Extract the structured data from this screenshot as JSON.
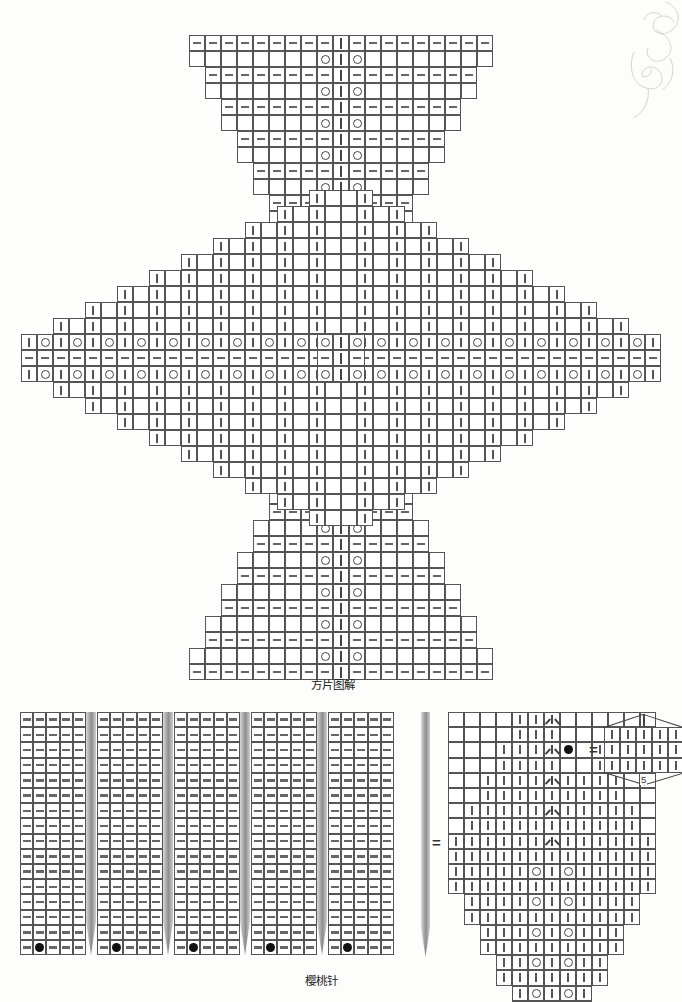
{
  "page": {
    "background": "#fdfdfb",
    "grid_line_color": "#555555",
    "symbol_color": "#444444",
    "needle_color": "#9b9b9b"
  },
  "captions": {
    "square_motif": "方片图解",
    "cherry_stitch": "樱桃针"
  },
  "legend": {
    "equals": "=",
    "bobble_count": "5",
    "symbols": [
      {
        "name": "purl",
        "glyph": "dash",
        "meaning_cn": "上针"
      },
      {
        "name": "knit",
        "glyph": "bar",
        "meaning_cn": "下针"
      },
      {
        "name": "yarn-over",
        "glyph": "circle",
        "meaning_cn": "加针"
      },
      {
        "name": "bobble",
        "glyph": "filled-dot",
        "meaning_cn": "樱桃结"
      },
      {
        "name": "decrease",
        "glyph": "peak",
        "meaning_cn": "并针"
      }
    ]
  },
  "chart_data": {
    "type": "table",
    "title": "方片图解",
    "cell_px": 16,
    "motif": {
      "name": "square-motif-pinwheel",
      "center_x": 341,
      "center_y": 358,
      "description": "four triangular wedges radiating from centre, each with a dashed knit spine and paired yarn-overs",
      "top_triangle": {
        "rows": 20,
        "top_width_cells": 19,
        "bottom_width_cells": 1,
        "origin_x": 188,
        "origin_y": 35,
        "row_pairs": [
          {
            "kind": "purl",
            "cells": 19
          },
          {
            "kind": "yo",
            "cells": 19
          },
          {
            "kind": "purl",
            "cells": 17
          },
          {
            "kind": "yo",
            "cells": 17
          },
          {
            "kind": "purl",
            "cells": 15
          },
          {
            "kind": "yo",
            "cells": 15
          },
          {
            "kind": "purl",
            "cells": 13
          },
          {
            "kind": "yo",
            "cells": 13
          },
          {
            "kind": "purl",
            "cells": 11
          },
          {
            "kind": "yo",
            "cells": 11
          },
          {
            "kind": "purl",
            "cells": 9
          },
          {
            "kind": "yo",
            "cells": 9
          },
          {
            "kind": "purl",
            "cells": 7
          },
          {
            "kind": "yo",
            "cells": 7
          },
          {
            "kind": "purl",
            "cells": 5
          },
          {
            "kind": "yo",
            "cells": 5
          },
          {
            "kind": "purl",
            "cells": 3
          },
          {
            "kind": "yo",
            "cells": 3
          }
        ]
      },
      "bottom_triangle": {
        "rows": 20,
        "top_width_cells": 1,
        "bottom_width_cells": 19
      },
      "left_wing": {
        "cols": 20,
        "outer_height_cells": 1,
        "inner_height_cells": 19
      },
      "right_wing": {
        "cols": 20,
        "outer_height_cells": 1,
        "inner_height_cells": 19
      },
      "band_rows": [
        "yo-alt",
        "purl",
        "yo-alt"
      ],
      "band_cols": [
        "yo-alt",
        "knit",
        "yo-alt"
      ]
    },
    "cherry_swatch": {
      "name": "cherry-stitch-swatch",
      "origin_x": 20,
      "origin_y": 712,
      "blocks": 5,
      "cols_per_block": 5,
      "rows": 16,
      "cell_symbol": "purl",
      "needle_between_blocks": true,
      "bobble_row": 16,
      "bobble_col_in_block": 2
    },
    "detail_chart": {
      "name": "cherry-stitch-detail",
      "origin_x": 448,
      "origin_y": 712,
      "cols": 13,
      "rows": 16,
      "decrease_col": 7,
      "yarn_over_cols": [
        6,
        8
      ],
      "taper": "widens to mid-chart then narrows"
    }
  }
}
